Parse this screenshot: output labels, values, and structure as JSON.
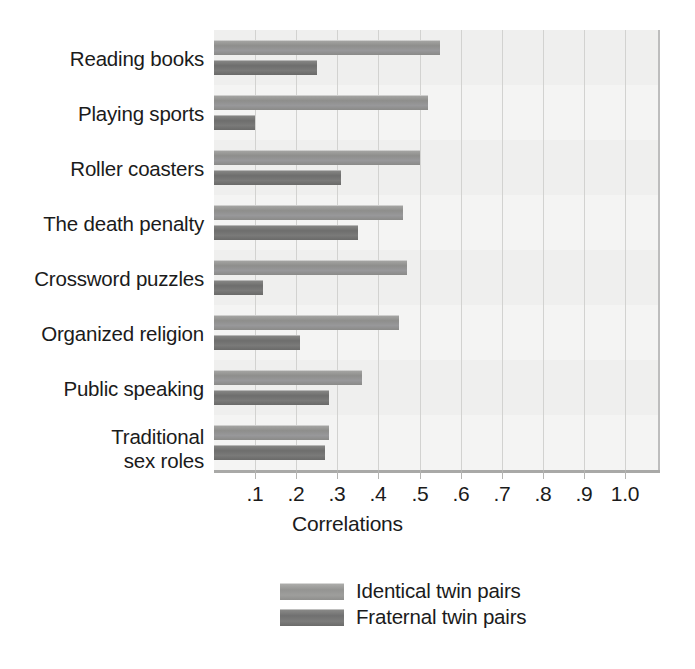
{
  "chart_data": {
    "type": "bar",
    "orientation": "horizontal",
    "title": "",
    "xlabel": "Correlations",
    "ylabel": "",
    "xlim": [
      0,
      1.08
    ],
    "xticks": [
      0.1,
      0.2,
      0.3,
      0.4,
      0.5,
      0.6,
      0.7,
      0.8,
      0.9,
      1.0
    ],
    "xtick_labels": [
      ".1",
      ".2",
      ".3",
      ".4",
      ".5",
      ".6",
      ".7",
      ".8",
      ".9",
      "1.0"
    ],
    "grid": true,
    "legend_position": "bottom",
    "categories": [
      "Reading books",
      "Playing sports",
      "Roller coasters",
      "The death penalty",
      "Crossword puzzles",
      "Organized religion",
      "Public speaking",
      "Traditional\nsex roles"
    ],
    "series": [
      {
        "name": "Identical twin pairs",
        "color": "#949492",
        "values": [
          0.55,
          0.52,
          0.5,
          0.46,
          0.47,
          0.45,
          0.36,
          0.28
        ]
      },
      {
        "name": "Fraternal twin pairs",
        "color": "#707070",
        "values": [
          0.25,
          0.1,
          0.31,
          0.35,
          0.12,
          0.21,
          0.28,
          0.27
        ]
      }
    ]
  },
  "legend": {
    "items": [
      {
        "label": "Identical twin pairs",
        "swatch": "identical"
      },
      {
        "label": "Fraternal twin pairs",
        "swatch": "fraternal"
      }
    ]
  }
}
